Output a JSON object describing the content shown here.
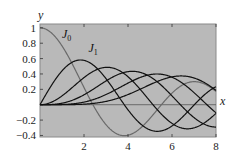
{
  "chart_data": {
    "type": "line",
    "title": "",
    "xlabel": "x",
    "ylabel": "y",
    "xlim": [
      0,
      8
    ],
    "ylim": [
      -0.42,
      1.05
    ],
    "grid": false,
    "background": "#b9b9b9",
    "x_ticks": [
      2,
      4,
      6,
      8
    ],
    "x_tick_labels": [
      "2",
      "4",
      "6",
      "8"
    ],
    "y_ticks": [
      1,
      0.8,
      0.6,
      0.4,
      0.2,
      -0.2,
      -0.4
    ],
    "y_tick_labels": [
      "1",
      "0.8",
      "0.6",
      "0.4",
      "0.2",
      "−0.2",
      "−0.4"
    ],
    "annotations": [
      {
        "text": "J",
        "sub": "0",
        "x": 1.0,
        "y": 0.87
      },
      {
        "text": "J",
        "sub": "1",
        "x": 2.2,
        "y": 0.68
      }
    ],
    "x": [
      0,
      0.5,
      1,
      1.5,
      2,
      2.5,
      3,
      3.5,
      4,
      4.5,
      5,
      5.5,
      6,
      6.5,
      7,
      7.5,
      8
    ],
    "series": [
      {
        "name": "J0",
        "order": 0,
        "color": "#6a6a6a",
        "values": [
          1.0,
          0.938,
          0.765,
          0.512,
          0.224,
          -0.048,
          -0.26,
          -0.38,
          -0.397,
          -0.321,
          -0.178,
          -0.007,
          0.151,
          0.26,
          0.3,
          0.266,
          0.172
        ]
      },
      {
        "name": "J1",
        "order": 1,
        "color": "#111111",
        "values": [
          0.0,
          0.242,
          0.44,
          0.558,
          0.577,
          0.497,
          0.339,
          0.137,
          -0.066,
          -0.231,
          -0.328,
          -0.341,
          -0.277,
          -0.154,
          -0.005,
          0.135,
          0.235
        ]
      },
      {
        "name": "J2",
        "order": 2,
        "color": "#111111",
        "values": [
          0.0,
          0.031,
          0.115,
          0.232,
          0.353,
          0.446,
          0.486,
          0.459,
          0.364,
          0.218,
          0.047,
          -0.117,
          -0.243,
          -0.307,
          -0.301,
          -0.23,
          -0.113
        ]
      },
      {
        "name": "J3",
        "order": 3,
        "color": "#111111",
        "values": [
          0.0,
          0.003,
          0.02,
          0.061,
          0.129,
          0.217,
          0.309,
          0.387,
          0.43,
          0.425,
          0.365,
          0.256,
          0.115,
          -0.035,
          -0.168,
          -0.258,
          -0.291
        ]
      },
      {
        "name": "J4",
        "order": 4,
        "color": "#111111",
        "values": [
          0.0,
          0.0,
          0.002,
          0.011,
          0.034,
          0.074,
          0.132,
          0.204,
          0.281,
          0.348,
          0.391,
          0.397,
          0.358,
          0.275,
          0.158,
          0.024,
          -0.105
        ]
      },
      {
        "name": "J5",
        "order": 5,
        "color": "#111111",
        "values": [
          0.0,
          0.0,
          0.0,
          0.002,
          0.007,
          0.019,
          0.043,
          0.08,
          0.132,
          0.195,
          0.261,
          0.321,
          0.362,
          0.374,
          0.348,
          0.283,
          0.186
        ]
      }
    ]
  }
}
